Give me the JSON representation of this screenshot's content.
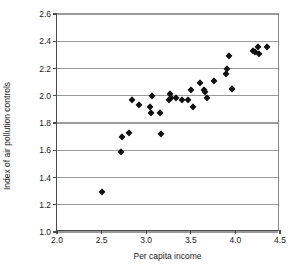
{
  "chart_data": {
    "type": "scatter",
    "title": "",
    "xlabel": "Per capita income",
    "ylabel": "Index of air pollution controls",
    "xlim": [
      2.0,
      4.5
    ],
    "ylim": [
      1.0,
      2.6
    ],
    "xticks": [
      "2.0",
      "2.5",
      "3.0",
      "3.5",
      "4.0",
      "4.5"
    ],
    "xtick_values": [
      2.0,
      2.5,
      3.0,
      3.5,
      4.0,
      4.5
    ],
    "yticks": [
      "1.0",
      "1.2",
      "1.4",
      "1.6",
      "1.8",
      "2.0",
      "2.2",
      "2.4",
      "2.6"
    ],
    "ytick_values": [
      1.0,
      1.2,
      1.4,
      1.6,
      1.8,
      2.0,
      2.2,
      2.4,
      2.6
    ],
    "grid": "horizontal",
    "legend": null,
    "marker": "diamond",
    "marker_color": "#111111",
    "points": [
      {
        "x": 2.5,
        "y": 1.29
      },
      {
        "x": 2.72,
        "y": 1.59
      },
      {
        "x": 2.73,
        "y": 1.7
      },
      {
        "x": 2.81,
        "y": 1.73
      },
      {
        "x": 2.84,
        "y": 1.97
      },
      {
        "x": 2.92,
        "y": 1.93
      },
      {
        "x": 3.04,
        "y": 1.92
      },
      {
        "x": 3.05,
        "y": 1.87
      },
      {
        "x": 3.07,
        "y": 2.0
      },
      {
        "x": 3.16,
        "y": 1.87
      },
      {
        "x": 3.17,
        "y": 1.72
      },
      {
        "x": 3.25,
        "y": 1.97
      },
      {
        "x": 3.27,
        "y": 2.01
      },
      {
        "x": 3.28,
        "y": 1.98
      },
      {
        "x": 3.33,
        "y": 1.98
      },
      {
        "x": 3.4,
        "y": 1.97
      },
      {
        "x": 3.47,
        "y": 1.97
      },
      {
        "x": 3.5,
        "y": 2.04
      },
      {
        "x": 3.52,
        "y": 1.92
      },
      {
        "x": 3.6,
        "y": 2.09
      },
      {
        "x": 3.65,
        "y": 2.04
      },
      {
        "x": 3.66,
        "y": 2.03
      },
      {
        "x": 3.68,
        "y": 1.98
      },
      {
        "x": 3.76,
        "y": 2.11
      },
      {
        "x": 3.9,
        "y": 2.16
      },
      {
        "x": 3.91,
        "y": 2.2
      },
      {
        "x": 3.93,
        "y": 2.29
      },
      {
        "x": 3.96,
        "y": 2.05
      },
      {
        "x": 4.2,
        "y": 2.33
      },
      {
        "x": 4.22,
        "y": 2.32
      },
      {
        "x": 4.25,
        "y": 2.36
      },
      {
        "x": 4.26,
        "y": 2.31
      },
      {
        "x": 4.35,
        "y": 2.36
      }
    ]
  }
}
